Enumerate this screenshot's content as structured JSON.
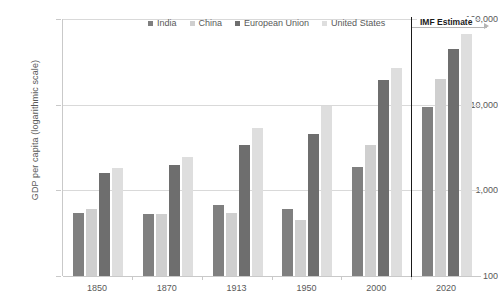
{
  "chart_data": {
    "type": "bar",
    "title": "",
    "xlabel": "",
    "ylabel": "GDP per capita (logarithmic scale)",
    "scale": "log",
    "grid": true,
    "legend_position": "top-center",
    "ylim": [
      100,
      100000
    ],
    "yticks": [
      100,
      1000,
      10000,
      100000
    ],
    "ytick_labels": [
      "100",
      "1,000",
      "10,000",
      "100,000"
    ],
    "categories": [
      "1850",
      "1870",
      "1913",
      "1950",
      "2000",
      "2020"
    ],
    "series": [
      {
        "name": "India",
        "color": "#7f7f7f",
        "values": [
          550,
          530,
          680,
          600,
          1850,
          9500
        ]
      },
      {
        "name": "China",
        "color": "#cfcfcf",
        "values": [
          600,
          530,
          550,
          450,
          3400,
          20000
        ]
      },
      {
        "name": "European Union",
        "color": "#6e6e6e",
        "values": [
          1600,
          2000,
          3400,
          4500,
          19500,
          45000
        ]
      },
      {
        "name": "United States",
        "color": "#dedede",
        "values": [
          1800,
          2450,
          5300,
          9600,
          27000,
          67000
        ]
      }
    ],
    "annotations": [
      {
        "name": "imf-estimate",
        "label": "IMF Estimate",
        "applies_to": [
          "2020"
        ]
      }
    ]
  }
}
